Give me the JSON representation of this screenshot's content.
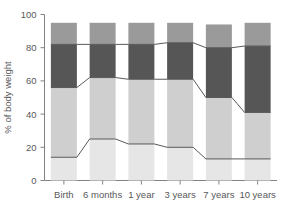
{
  "chart_data": {
    "type": "bar",
    "title": "",
    "subtitle": "",
    "xlabel": "",
    "ylabel": "% of body weight",
    "ylim": [
      0,
      100
    ],
    "yticks": [
      0,
      20,
      40,
      60,
      80,
      100
    ],
    "grid": false,
    "legend": "none",
    "stacked": true,
    "connector_lines": true,
    "categories": [
      "Birth",
      "6 months",
      "1 year",
      "3 years",
      "7 years",
      "10 years"
    ],
    "series": [
      {
        "name": "segment-1-bottom",
        "color": "#e6e6e6",
        "values": [
          14,
          25,
          22,
          20,
          13,
          13
        ]
      },
      {
        "name": "segment-2",
        "color": "#cfcfcf",
        "values": [
          42,
          37,
          39,
          41,
          37,
          28
        ]
      },
      {
        "name": "segment-3-dark",
        "color": "#565656",
        "values": [
          26,
          20,
          21,
          22,
          30,
          40
        ]
      },
      {
        "name": "segment-4-top",
        "color": "#9a9a9a",
        "values": [
          13,
          13,
          13,
          12,
          14,
          14
        ]
      }
    ],
    "cumulative_boundaries": {
      "boundary_1": [
        14,
        25,
        22,
        20,
        13,
        13
      ],
      "boundary_2": [
        56,
        62,
        61,
        61,
        50,
        41
      ],
      "boundary_3": [
        82,
        82,
        82,
        83,
        80,
        81
      ],
      "bar_top": [
        95,
        95,
        95,
        95,
        94,
        95
      ]
    }
  },
  "axis": {
    "y_tick_labels": [
      "100",
      "80",
      "60",
      "40",
      "20",
      "0"
    ],
    "y_axis_title": "% of body weight",
    "x_tick_labels": [
      "Birth",
      "6 months",
      "1 year",
      "3 years",
      "7 years",
      "10 years"
    ]
  },
  "colors": {
    "axis": "#808285",
    "text": "#58595b",
    "connector": "#58595b",
    "background": "#ffffff"
  }
}
